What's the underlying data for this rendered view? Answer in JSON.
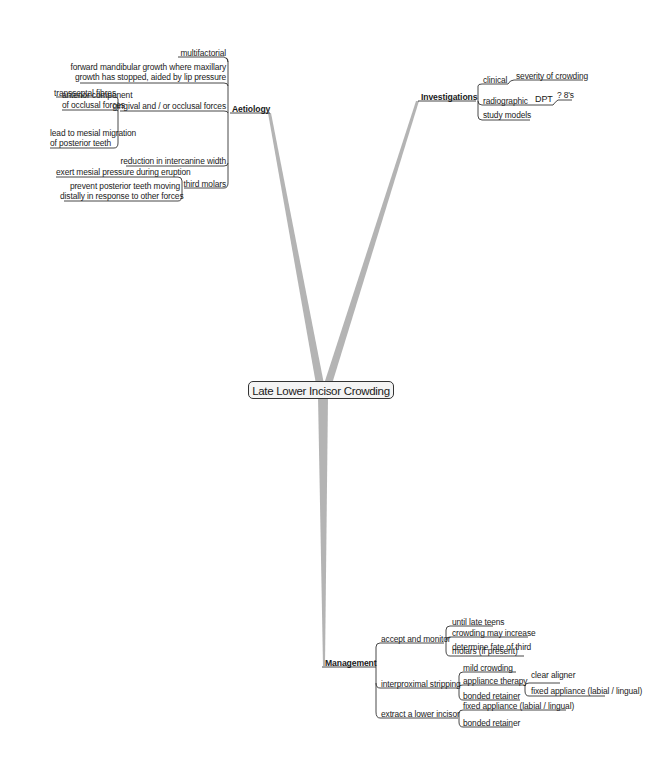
{
  "central_topic": "Late Lower Incisor Crowding",
  "colors": {
    "trunk": "#b4b4b4",
    "line": "#333333",
    "center_fill": "#f4f4f4"
  },
  "branches": {
    "aetiology": {
      "label": "Aetiology",
      "children": {
        "multifactorial": "multifactorial",
        "forward_growth_1": "forward mandibular growth where maxillary",
        "forward_growth_2": "growth has stopped, aided by lip pressure",
        "gingival": "gingival and / or occlusal forces",
        "gingival_children": {
          "transseptal": "transseptal fibres",
          "anterior_1": "anterior component",
          "anterior_2": "of occlusal forces",
          "mesial_1": "lead to mesial migration",
          "mesial_2": "of posterior teeth"
        },
        "intercanine": "reduction in intercanine width",
        "third_molars": "third molars",
        "third_molars_children": {
          "exert": "exert mesial pressure during eruption",
          "prevent_1": "prevent posterior teeth moving",
          "prevent_2": "distally in response to other forces"
        }
      }
    },
    "investigations": {
      "label": "Investigations",
      "children": {
        "clinical": "clinical",
        "clinical_child": "severity of crowding",
        "radiographic": "radiographic",
        "dpt": "DPT",
        "dpt_child": "? 8's",
        "study_models": "study models"
      }
    },
    "management": {
      "label": "Management",
      "children": {
        "accept": "accept and monitor",
        "accept_children": {
          "until": "until late teens",
          "crowding": "crowding may increase",
          "determine_1": "determine fate of third",
          "determine_2": "molars (if present)"
        },
        "ipr": "interproximal stripping",
        "ipr_children": {
          "mild": "mild crowding",
          "appliance": "appliance therapy",
          "appliance_children": {
            "clear": "clear aligner",
            "fixed": "fixed appliance (labial / lingual)"
          },
          "bonded": "bonded retainer"
        },
        "extract": "extract a lower incisor",
        "extract_children": {
          "fixed": "fixed appliance (labial / lingual)",
          "bonded": "bonded retainer"
        }
      }
    }
  }
}
